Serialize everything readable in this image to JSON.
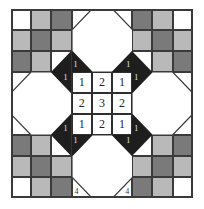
{
  "figure": {
    "type": "diagram",
    "grid": {
      "cols": 9,
      "rows": 9,
      "cell_w": 20.2,
      "cell_h": 21.0
    },
    "colors": {
      "white": "#ffffff",
      "light_gray": "#b9b9b9",
      "mid_gray": "#9a9a9a",
      "dark_gray": "#7a7a7a",
      "black": "#1e1e1e",
      "line": "#3a3a3a"
    }
  },
  "center_grid": {
    "label": "center 3x3 numbers",
    "rows": [
      [
        "1",
        "2",
        "1"
      ],
      [
        "2",
        "3",
        "2"
      ],
      [
        "1",
        "2",
        "1"
      ]
    ]
  },
  "corner_labels": {
    "inner_ring": [
      "1",
      "1",
      "1",
      "1",
      "1",
      "1",
      "1",
      "1"
    ],
    "bottom": [
      "4",
      "4"
    ]
  },
  "checker": {
    "top_left": [
      [
        "white",
        "light_gray",
        "dark_gray"
      ],
      [
        "light_gray",
        "dark_gray",
        "light_gray"
      ],
      [
        "dark_gray",
        "light_gray",
        "white"
      ]
    ],
    "top_right": [
      [
        "dark_gray",
        "light_gray",
        "white"
      ],
      [
        "light_gray",
        "dark_gray",
        "light_gray"
      ],
      [
        "white",
        "light_gray",
        "dark_gray"
      ]
    ],
    "bottom_left": [
      [
        "dark_gray",
        "light_gray",
        "white"
      ],
      [
        "light_gray",
        "dark_gray",
        "light_gray"
      ],
      [
        "white",
        "light_gray",
        "dark_gray"
      ]
    ],
    "bottom_right": [
      [
        "white",
        "light_gray",
        "dark_gray"
      ],
      [
        "light_gray",
        "dark_gray",
        "light_gray"
      ],
      [
        "dark_gray",
        "light_gray",
        "white"
      ]
    ]
  },
  "octagons": {
    "count": 4,
    "positions": [
      "top-center",
      "bottom-center",
      "left-middle",
      "right-middle"
    ],
    "fill": "#ffffff"
  }
}
